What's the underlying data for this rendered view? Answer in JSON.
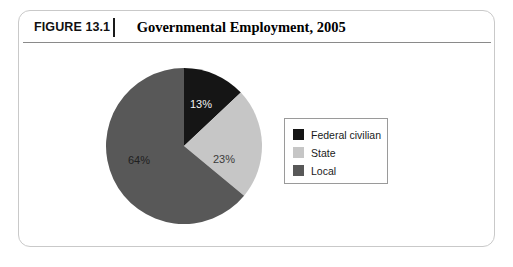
{
  "figure": {
    "number": "FIGURE 13.1",
    "title": "Governmental Employment, 2005"
  },
  "legend": {
    "items": [
      {
        "label": "Federal civilian",
        "color": "#151515"
      },
      {
        "label": "State",
        "color": "#c6c6c6"
      },
      {
        "label": "Local",
        "color": "#585858"
      }
    ]
  },
  "chart_data": {
    "type": "pie",
    "title": "Governmental Employment, 2005",
    "categories": [
      "Federal civilian",
      "State",
      "Local"
    ],
    "values": [
      13,
      23,
      64
    ],
    "value_labels": [
      "13%",
      "23%",
      "64%"
    ],
    "colors": [
      "#151515",
      "#c6c6c6",
      "#585858"
    ],
    "label_text_colors": [
      "#f2f2f2",
      "#3b3b3b",
      "#1f1f1f"
    ],
    "units": "percent",
    "start_angle_deg": 0,
    "direction": "clockwise",
    "legend_position": "right",
    "grid": false,
    "xlabel": "",
    "ylabel": ""
  }
}
